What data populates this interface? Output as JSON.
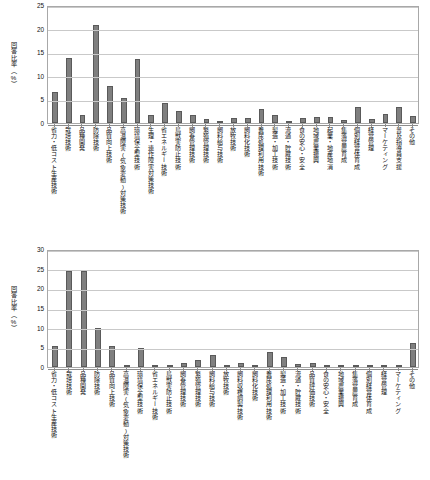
{
  "chart_data": [
    {
      "id": "top",
      "type": "bar",
      "title": "",
      "xlabel": "",
      "ylabel": "回答比率（%）",
      "ylim": [
        0,
        25
      ],
      "yticks": [
        0,
        5,
        10,
        15,
        20,
        25
      ],
      "ytick_labels": [
        "0",
        "5",
        "10",
        "15",
        "20",
        "25"
      ],
      "grid": true,
      "legend": "none",
      "bar_color": "#7f7f7f",
      "bar_edge_color": "#5a5a5a",
      "categories": [
        "省力・低コスト生産技術",
        "栽培技術",
        "品種開発",
        "防除技術",
        "品質向上技術",
        "高温障害(気象変動)対策技術",
        "環境保全型技術",
        "生理・連作障害対策技術",
        "省エネルギー技術",
        "鳥獣害防止技術",
        "飼養管理技術",
        "繁殖管理技術",
        "飼料給与技術",
        "放牧技術",
        "飼料化技術",
        "糞尿処理利用技術",
        "製造・加工技術",
        "流通・貯蔵技術",
        "食の安心・安全",
        "地域農業振興",
        "起業・地産地消",
        "集落営農育成",
        "個別経営体育成",
        "経営管理",
        "マーケティング",
        "普及指導員支援",
        "その他"
      ],
      "values": [
        6.5,
        13.8,
        1.6,
        20.8,
        7.9,
        5.3,
        13.6,
        1.6,
        4.3,
        2.5,
        1.7,
        0.9,
        0.3,
        1.0,
        1.1,
        3.0,
        1.7,
        0.4,
        1.1,
        1.2,
        1.2,
        0.6,
        3.4,
        0.9,
        2.0,
        3.3,
        1.5
      ]
    },
    {
      "id": "bottom",
      "type": "bar",
      "title": "",
      "xlabel": "",
      "ylabel": "回答比率（%）",
      "ylim": [
        0,
        30
      ],
      "yticks": [
        0,
        5,
        10,
        15,
        20,
        25,
        30
      ],
      "ytick_labels": [
        "0",
        "5",
        "10",
        "15",
        "20",
        "25",
        "30"
      ],
      "grid": true,
      "legend": "none",
      "bar_color": "#7f7f7f",
      "bar_edge_color": "#5a5a5a",
      "categories": [
        "省力・低コスト生産技術",
        "栽培技術",
        "品種開発",
        "防除技術",
        "品質向上技術",
        "高温障害(気象変動)対策技術",
        "環境保全型技術",
        "省エネルギー技術",
        "鳥獣害防止技術",
        "飼養管理技術",
        "繁殖管理技術",
        "飼料給与技術",
        "放牧技術",
        "飼料収穫調製技術",
        "飼料化技術",
        "糞尿処理利用技術",
        "製造・加工技術",
        "流通・貯蔵技術",
        "品質評価技術",
        "食の安心・安全",
        "地域農業振興",
        "集落営農育成",
        "個別経営体育成",
        "経営管理",
        "マーケティング",
        "その他"
      ],
      "values": [
        5.3,
        24.5,
        24.3,
        9.9,
        5.3,
        0.4,
        4.9,
        0.3,
        0.2,
        0.9,
        1.7,
        3.1,
        0.5,
        1.1,
        0.5,
        3.9,
        2.6,
        0.7,
        1.1,
        0.4,
        0.2,
        0.2,
        0.3,
        0.3,
        0.2,
        6.1
      ]
    }
  ]
}
